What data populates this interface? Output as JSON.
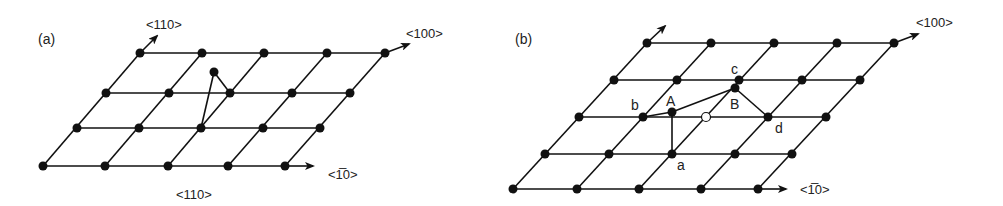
{
  "panels": [
    {
      "id": "a",
      "label": "(a)",
      "label_pos": [
        38,
        44
      ],
      "rows": [
        [
          [
            140,
            53
          ],
          [
            202,
            53
          ],
          [
            264,
            53
          ],
          [
            327,
            53
          ],
          [
            385,
            53
          ]
        ],
        [
          [
            106,
            93
          ],
          [
            169,
            93
          ],
          [
            230,
            93
          ],
          [
            292,
            93
          ],
          [
            350,
            93
          ]
        ],
        [
          [
            77,
            128
          ],
          [
            139,
            128
          ],
          [
            201,
            128
          ],
          [
            263,
            128
          ],
          [
            320,
            128
          ]
        ],
        [
          [
            43,
            166
          ],
          [
            105,
            166
          ],
          [
            168,
            166
          ],
          [
            228,
            166
          ],
          [
            285,
            166
          ]
        ]
      ],
      "extra_atoms": [
        [
          214,
          72
        ]
      ],
      "vacancies": [],
      "bonds": [
        [
          [
            214,
            72
          ],
          [
            201,
            128
          ]
        ],
        [
          [
            214,
            72
          ],
          [
            230,
            93
          ]
        ]
      ],
      "arrows": [
        {
          "from": [
            140,
            53
          ],
          "to": [
            157,
            36
          ]
        },
        {
          "from": [
            385,
            53
          ],
          "to": [
            409,
            44
          ]
        },
        {
          "from": [
            285,
            166
          ],
          "to": [
            313,
            166
          ]
        }
      ],
      "direction_labels": [
        {
          "text": "<110>",
          "x": 146,
          "y": 29
        },
        {
          "text": "<100>",
          "x": 406,
          "y": 38
        },
        {
          "text": "<1̅0>",
          "x": 328,
          "y": 179
        },
        {
          "text": "<110>",
          "x": 176,
          "y": 199
        }
      ],
      "site_labels": []
    },
    {
      "id": "b",
      "label": "(b)",
      "label_pos": [
        515,
        44
      ],
      "rows": [
        [
          [
            647,
            43
          ],
          [
            711,
            43
          ],
          [
            774,
            43
          ],
          [
            837,
            43
          ],
          [
            894,
            43
          ]
        ],
        [
          [
            614,
            80
          ],
          [
            677,
            80
          ],
          [
            739,
            80
          ],
          [
            802,
            80
          ],
          [
            860,
            80
          ]
        ],
        [
          [
            579,
            117
          ],
          [
            643,
            117
          ],
          [
            706,
            117
          ],
          [
            768,
            117
          ],
          [
            826,
            117
          ]
        ],
        [
          [
            545,
            154
          ],
          [
            609,
            154
          ],
          [
            672,
            154
          ],
          [
            735,
            154
          ],
          [
            792,
            154
          ]
        ],
        [
          [
            513,
            189
          ],
          [
            577,
            189
          ],
          [
            639,
            189
          ],
          [
            701,
            189
          ],
          [
            758,
            189
          ]
        ]
      ],
      "skip_atoms": [
        [
          2,
          2
        ]
      ],
      "extra_atoms": [
        [
          672,
          112
        ],
        [
          735,
          88
        ]
      ],
      "vacancies": [
        [
          706,
          117
        ]
      ],
      "bonds": [
        [
          [
            643,
            117
          ],
          [
            672,
            112
          ]
        ],
        [
          [
            672,
            112
          ],
          [
            735,
            88
          ]
        ],
        [
          [
            672,
            112
          ],
          [
            672,
            154
          ]
        ],
        [
          [
            735,
            88
          ],
          [
            768,
            117
          ]
        ]
      ],
      "arrows": [
        {
          "from": [
            647,
            43
          ],
          "to": [
            665,
            26
          ]
        },
        {
          "from": [
            894,
            43
          ],
          "to": [
            918,
            34
          ]
        },
        {
          "from": [
            758,
            189
          ],
          "to": [
            786,
            189
          ]
        }
      ],
      "direction_labels": [
        {
          "text": "<100>",
          "x": 916,
          "y": 27
        },
        {
          "text": "<1̅0>",
          "x": 800,
          "y": 194
        }
      ],
      "site_labels": [
        {
          "text": "A",
          "x": 666,
          "y": 106
        },
        {
          "text": "B",
          "x": 730,
          "y": 109
        },
        {
          "text": "a",
          "x": 677,
          "y": 170
        },
        {
          "text": "b",
          "x": 631,
          "y": 110
        },
        {
          "text": "c",
          "x": 731,
          "y": 74
        },
        {
          "text": "d",
          "x": 775,
          "y": 133
        }
      ]
    }
  ]
}
